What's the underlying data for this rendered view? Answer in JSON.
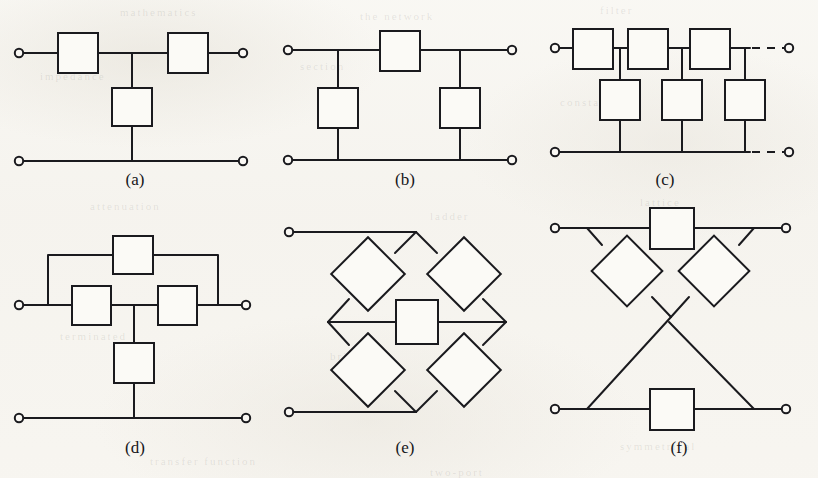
{
  "figure": {
    "kind": "scanned-textbook-figure",
    "width": 818,
    "height": 478,
    "background_color": "#f6f4ef",
    "ink_color": "#1a1a1e",
    "box_fill_color": "#fbfaf6"
  },
  "ghost_marks": [
    {
      "text": "mathematics",
      "x": 120,
      "y": 6
    },
    {
      "text": "the network",
      "x": 360,
      "y": 10
    },
    {
      "text": "filter",
      "x": 600,
      "y": 4
    },
    {
      "text": "impedance",
      "x": 40,
      "y": 70
    },
    {
      "text": "section",
      "x": 300,
      "y": 60
    },
    {
      "text": "constant",
      "x": 560,
      "y": 96
    },
    {
      "text": "attenuation",
      "x": 90,
      "y": 200
    },
    {
      "text": "ladder",
      "x": 430,
      "y": 210
    },
    {
      "text": "lattice",
      "x": 640,
      "y": 196
    },
    {
      "text": "terminated",
      "x": 60,
      "y": 330
    },
    {
      "text": "bridged-T",
      "x": 330,
      "y": 350
    },
    {
      "text": "symmetrical",
      "x": 620,
      "y": 440
    },
    {
      "text": "transfer function",
      "x": 150,
      "y": 455
    },
    {
      "text": "two-port",
      "x": 430,
      "y": 466
    }
  ],
  "cells": [
    {
      "id": "a",
      "label": "(a)",
      "name": "L-section-network",
      "terminal_count": 3,
      "box_count": 3,
      "boxes": [
        {
          "role": "series-box-left"
        },
        {
          "role": "series-box-right"
        },
        {
          "role": "shunt-box"
        }
      ]
    },
    {
      "id": "b",
      "label": "(b)",
      "name": "pi-section-network",
      "terminal_count": 4,
      "box_count": 3,
      "boxes": [
        {
          "role": "series-box"
        },
        {
          "role": "shunt-box-left"
        },
        {
          "role": "shunt-box-right"
        }
      ]
    },
    {
      "id": "c",
      "label": "(c)",
      "name": "ladder-network",
      "terminal_count": 4,
      "box_count": 6,
      "continues": true,
      "boxes": [
        {
          "role": "series-box-1"
        },
        {
          "role": "series-box-2"
        },
        {
          "role": "series-box-3"
        },
        {
          "role": "shunt-box-1"
        },
        {
          "role": "shunt-box-2"
        },
        {
          "role": "shunt-box-3"
        }
      ]
    },
    {
      "id": "d",
      "label": "(d)",
      "name": "bridged-T-network",
      "terminal_count": 4,
      "box_count": 4,
      "boxes": [
        {
          "role": "bridging-box-top"
        },
        {
          "role": "series-box-left"
        },
        {
          "role": "series-box-right"
        },
        {
          "role": "shunt-box"
        }
      ]
    },
    {
      "id": "e",
      "label": "(e)",
      "name": "bridged-lattice-network",
      "terminal_count": 2,
      "box_count": 5,
      "boxes": [
        {
          "role": "lattice-box-upper-left"
        },
        {
          "role": "lattice-box-upper-right"
        },
        {
          "role": "lattice-box-lower-left"
        },
        {
          "role": "lattice-box-lower-right"
        },
        {
          "role": "bridging-box-centre"
        }
      ]
    },
    {
      "id": "f",
      "label": "(f)",
      "name": "lattice-network",
      "terminal_count": 4,
      "box_count": 4,
      "boxes": [
        {
          "role": "series-box-top"
        },
        {
          "role": "series-box-bottom"
        },
        {
          "role": "cross-box-left"
        },
        {
          "role": "cross-box-right"
        }
      ]
    }
  ]
}
